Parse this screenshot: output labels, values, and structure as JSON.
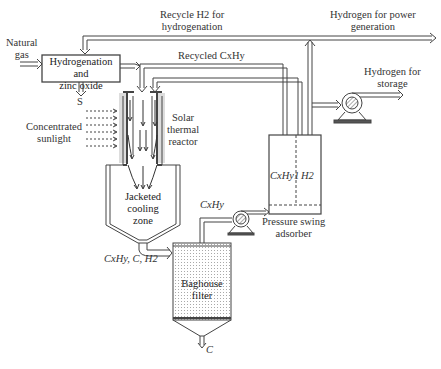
{
  "diagram": {
    "inputs": {
      "natural_gas": "Natural\ngas",
      "concentrated_sunlight": "Concentrated\nsunlight"
    },
    "units": {
      "hydrogenation": "Hydrogenation and\nzinc oxide",
      "solar_reactor": "Solar\nthermal\nreactor",
      "cooling_zone": "Jacketed\ncooling\nzone",
      "baghouse": "Baghouse\nfilter",
      "psa": "Pressure swing\nadsorber"
    },
    "streams": {
      "sulfur": "S",
      "recycle_h2": "Recycle H2 for\nhydrogenation",
      "recycled_cxhy": "Recycled CxHy",
      "h2_power": "Hydrogen for power\ngeneration",
      "h2_storage": "Hydrogen for\nstorage",
      "reactor_out": "CxHy, C, H2",
      "baghouse_gas": "CxHy",
      "carbon": "C",
      "psa_left": "CxHy1",
      "psa_right": "H2"
    }
  }
}
